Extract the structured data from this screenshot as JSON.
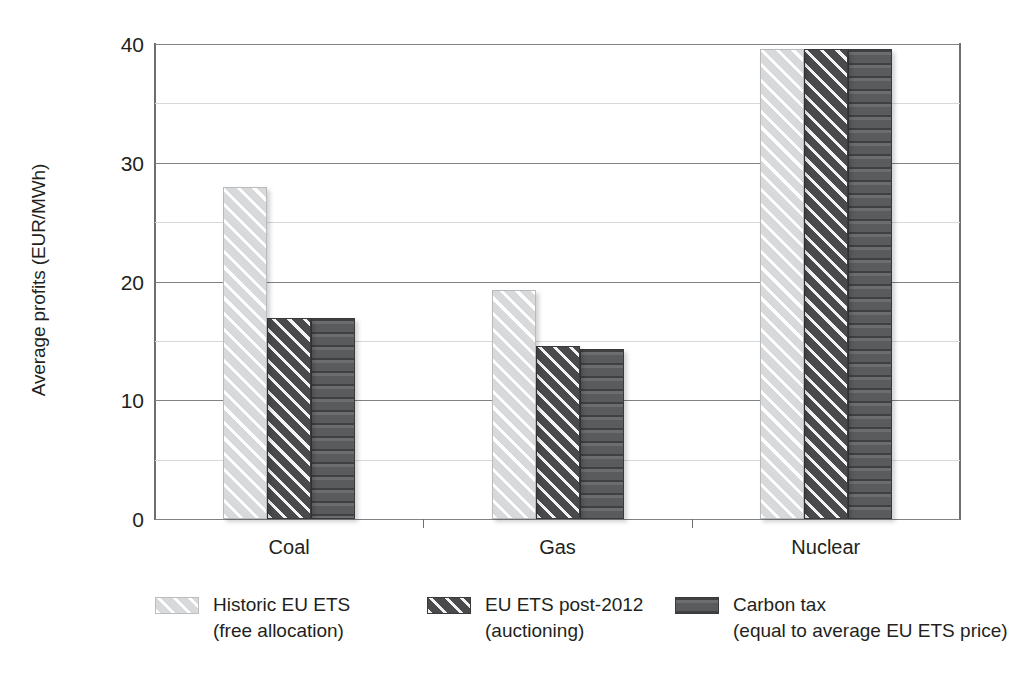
{
  "chart_data": {
    "type": "bar",
    "title": "",
    "xlabel": "",
    "ylabel": "Average profits (EUR/MWh)",
    "ylim": [
      0,
      40
    ],
    "yticks": [
      0,
      10,
      20,
      30,
      40
    ],
    "ytick_labels": [
      "0",
      "10",
      "20",
      "30",
      "40"
    ],
    "minor_gridlines": [
      5,
      15,
      25,
      35
    ],
    "grid": true,
    "legend_position": "bottom",
    "categories": [
      "Coal",
      "Gas",
      "Nuclear"
    ],
    "series": [
      {
        "name": "Historic EU ETS (free allocation)",
        "name_line1": "Historic EU ETS",
        "name_line2": "(free allocation)",
        "pattern": "light-grey-diagonal-hatch",
        "color": "#d8d9da",
        "values": [
          28.0,
          19.3,
          39.6
        ]
      },
      {
        "name": "EU ETS post-2012 (auctioning)",
        "name_line1": "EU ETS post-2012",
        "name_line2": "(auctioning)",
        "pattern": "dark-grey-diagonal-hatch",
        "color": "#4a4a4c",
        "values": [
          16.9,
          14.6,
          39.6
        ]
      },
      {
        "name": "Carbon tax (equal to average EU ETS price)",
        "name_line1": "Carbon tax",
        "name_line2": "(equal to average EU ETS price)",
        "pattern": "dark-grey-horizontal-stripes",
        "color": "#5d5e60",
        "values": [
          16.9,
          14.3,
          39.6
        ]
      }
    ]
  }
}
